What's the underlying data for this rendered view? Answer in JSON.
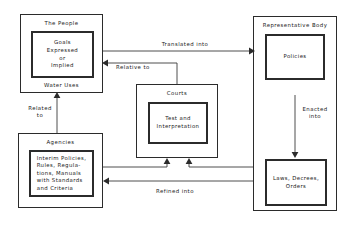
{
  "diagram": {
    "line_color": "#3a3a3a",
    "box_color": "#2b2b2b",
    "background": "#ffffff"
  },
  "nodes": {
    "people": {
      "title": "The People",
      "inner": "Goals\nExpressed\nor\nImplied",
      "footer": "Water Uses"
    },
    "agencies": {
      "title": "Agencies",
      "inner": "Interim Policies,\nRules, Regula-\ntions, Manuals\nwith  Standards\nand  Criteria"
    },
    "courts": {
      "title": "Courts",
      "inner": "Test and\nInterpretation"
    },
    "representative_body": {
      "title": "Representative Body",
      "policies": "Policies",
      "laws": "Laws, Decrees,\nOrders"
    }
  },
  "edges": [
    {
      "id": "translated-into",
      "label": "Translated into",
      "from": "people",
      "to": "representative_body"
    },
    {
      "id": "relative-to",
      "label": "Relative to",
      "from": "courts",
      "to": "people"
    },
    {
      "id": "related-to",
      "label": "Related\nto",
      "from": "agencies",
      "to": "people"
    },
    {
      "id": "enacted-into",
      "label": "Enacted\ninto",
      "from": "policies",
      "to": "laws"
    },
    {
      "id": "refined-into",
      "label": "Refined into",
      "from": "laws",
      "to": "agencies"
    },
    {
      "id": "agencies-to-courts",
      "label": "",
      "from": "agencies",
      "to": "courts"
    },
    {
      "id": "laws-to-courts",
      "label": "",
      "from": "laws",
      "to": "courts"
    }
  ]
}
